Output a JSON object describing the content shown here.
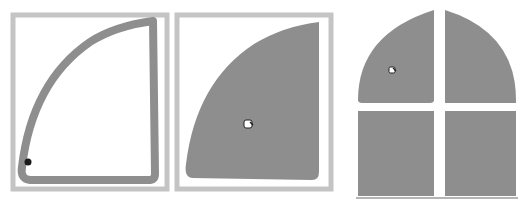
{
  "figure": {
    "colors": {
      "background": "#ffffff",
      "frame": "#c4c4c4",
      "fill": "#8e8e8e",
      "outline_stroke": "#8e8e8e",
      "cursor_dot": "#1a1a1a",
      "baseline": "#6a6a6a"
    },
    "panels": [
      {
        "id": "panel-1",
        "label": "Outlined shape before fill",
        "cursor": "dot-cursor"
      },
      {
        "id": "panel-2",
        "label": "Shape filled with paint bucket",
        "cursor": "paint-bucket-cursor"
      },
      {
        "id": "panel-3",
        "label": "Filled arched window with four panes",
        "cursor": "paint-bucket-cursor"
      }
    ]
  }
}
